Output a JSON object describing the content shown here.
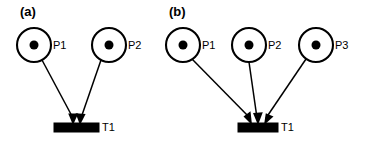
{
  "figure": {
    "background_color": "#ffffff",
    "foreground_color": "#000000",
    "width": 376,
    "height": 143
  },
  "panels": [
    {
      "id": "panel-a",
      "caption": "(a)",
      "caption_x": 20,
      "caption_y": 16,
      "places": [
        {
          "id": "a-p1",
          "label": "P1",
          "cx": 34,
          "cy": 45,
          "r": 17,
          "token_count": 1,
          "token_r": 4.5,
          "label_x": 53,
          "label_y": 49
        },
        {
          "id": "a-p2",
          "label": "P2",
          "cx": 109,
          "cy": 45,
          "r": 17,
          "token_count": 1,
          "token_r": 4.5,
          "label_x": 128,
          "label_y": 49
        }
      ],
      "transitions": [
        {
          "id": "a-t1",
          "label": "T1",
          "x": 54,
          "y": 123,
          "width": 45,
          "height": 9,
          "label_x": 102,
          "label_y": 131
        }
      ],
      "arcs": [
        {
          "id": "a-arc-p1-t1",
          "from": "a-p1",
          "to": "a-t1",
          "x1": 42,
          "y1": 60,
          "x2": 72,
          "y2": 122
        },
        {
          "id": "a-arc-p2-t1",
          "from": "a-p2",
          "to": "a-t1",
          "x1": 101,
          "y1": 60,
          "x2": 81,
          "y2": 122
        }
      ]
    },
    {
      "id": "panel-b",
      "caption": "(b)",
      "caption_x": 169,
      "caption_y": 16,
      "places": [
        {
          "id": "b-p1",
          "label": "P1",
          "cx": 183,
          "cy": 45,
          "r": 17,
          "token_count": 1,
          "token_r": 4.5,
          "label_x": 202,
          "label_y": 49
        },
        {
          "id": "b-p2",
          "label": "P2",
          "cx": 249,
          "cy": 45,
          "r": 17,
          "token_count": 1,
          "token_r": 4.5,
          "label_x": 268,
          "label_y": 49
        },
        {
          "id": "b-p3",
          "label": "P3",
          "cx": 316,
          "cy": 45,
          "r": 17,
          "token_count": 1,
          "token_r": 4.5,
          "label_x": 335,
          "label_y": 49
        }
      ],
      "transitions": [
        {
          "id": "b-t1",
          "label": "T1",
          "x": 238,
          "y": 123,
          "width": 40,
          "height": 9,
          "label_x": 281,
          "label_y": 131
        }
      ],
      "arcs": [
        {
          "id": "b-arc-p1-t1",
          "from": "b-p1",
          "to": "b-t1",
          "x1": 192,
          "y1": 60,
          "x2": 250,
          "y2": 122
        },
        {
          "id": "b-arc-p2-t1",
          "from": "b-p2",
          "to": "b-t1",
          "x1": 249,
          "y1": 62,
          "x2": 257,
          "y2": 122
        },
        {
          "id": "b-arc-p3-t1",
          "from": "b-p3",
          "to": "b-t1",
          "x1": 306,
          "y1": 60,
          "x2": 265,
          "y2": 122
        }
      ]
    }
  ]
}
